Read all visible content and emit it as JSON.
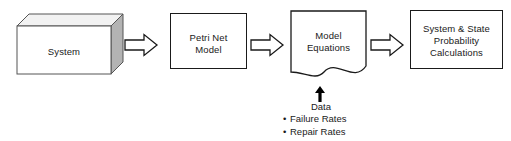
{
  "diagram": {
    "type": "process-flow",
    "orientation": "left-to-right",
    "background_color": "#ffffff",
    "stroke_color": "#1a1a1a",
    "text_color": "#1a1a1a",
    "nodes": [
      {
        "id": "system",
        "label": "System",
        "shape": "cube-3d",
        "fill": "#ffffff",
        "side_fill": "#b3b3b3",
        "top_fill": "#f2f2f2"
      },
      {
        "id": "petri",
        "label": "Petri Net\nModel",
        "shape": "rectangle",
        "fill": "#ffffff"
      },
      {
        "id": "equations",
        "label": "Model\nEquations",
        "shape": "document",
        "fill": "#ffffff"
      },
      {
        "id": "calculations",
        "label": "System & State\nProbability\nCalculations",
        "shape": "rectangle",
        "fill": "#ffffff"
      }
    ],
    "arrows": [
      {
        "id": "arrow-1",
        "from": "system",
        "to": "petri",
        "style": "hollow-block",
        "direction": "right"
      },
      {
        "id": "arrow-2",
        "from": "petri",
        "to": "equations",
        "style": "hollow-block",
        "direction": "right"
      },
      {
        "id": "arrow-3",
        "from": "equations",
        "to": "calculations",
        "style": "hollow-block",
        "direction": "right"
      }
    ],
    "annotation": {
      "id": "data-input",
      "target": "equations",
      "arrow_style": "solid-filled",
      "arrow_direction": "up",
      "caption": "Data",
      "items": [
        {
          "bullet": "•",
          "label": "Failure Rates"
        },
        {
          "bullet": "•",
          "label": "Repair Rates"
        }
      ]
    }
  }
}
